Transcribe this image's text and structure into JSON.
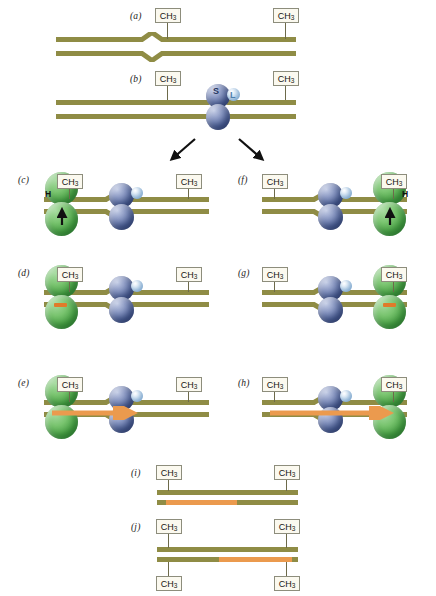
{
  "figure": {
    "type": "molecular-biology-process-diagram",
    "background_color": "#ffffff",
    "colors": {
      "dna_strand": "#8f8c45",
      "repaired_strand": "#eb9a4e",
      "mutS_protein": "#55699f",
      "mutL_protein": "#b6d4ee",
      "mutH_protein": "#4da548",
      "label_box_fill": "#fbf9ef",
      "label_box_border": "#8d8d7c",
      "arrow_black": "#111111",
      "arrow_orange": "#eb9a4e"
    }
  },
  "labels": {
    "methyl": "CH",
    "methyl_sub": "3",
    "protein_s": "S",
    "protein_l": "L",
    "protein_h": "H"
  },
  "panels": [
    {
      "id": "a",
      "letter": "(a)",
      "description": "Hemimethylated duplex DNA with a mismatch bulge (chevron kink) in the centre; CH3 methyl tags on both ends of the top strand.",
      "methyl_labels": [
        "CH3",
        "CH3"
      ],
      "has_mismatch": true,
      "proteins": []
    },
    {
      "id": "b",
      "letter": "(b)",
      "description": "MutS (S) binds the mismatch; MutL (L) joins the complex.",
      "methyl_labels": [
        "CH3",
        "CH3"
      ],
      "has_mismatch": true,
      "proteins": [
        "S",
        "L"
      ]
    },
    {
      "id": "c",
      "letter": "(c)",
      "description": "Left branch: MutH (H) binds the left hemimethylated GATC site; arrow marks incision.",
      "methyl_labels": [
        "CH3",
        "CH3"
      ],
      "proteins": [
        "S",
        "L",
        "H"
      ],
      "protein_side": "left",
      "has_black_arrow": true
    },
    {
      "id": "d",
      "letter": "(d)",
      "description": "Left branch: MutH nicks the unmethylated strand — small orange nick appears at the left.",
      "methyl_labels": [
        "CH3",
        "CH3"
      ],
      "proteins": [
        "S",
        "L",
        "H"
      ],
      "protein_side": "left",
      "has_nick": true
    },
    {
      "id": "e",
      "letter": "(e)",
      "description": "Left branch: excision and resynthesis proceed rightwards (orange arrow) past the mismatch.",
      "methyl_labels": [
        "CH3",
        "CH3"
      ],
      "proteins": [
        "S",
        "L",
        "H"
      ],
      "protein_side": "left",
      "has_orange_arrow": true,
      "orange_arrow_direction": "right"
    },
    {
      "id": "f",
      "letter": "(f)",
      "description": "Right branch: MutH (H) binds the right hemimethylated GATC site; arrow marks incision.",
      "methyl_labels": [
        "CH3",
        "CH3"
      ],
      "proteins": [
        "S",
        "L",
        "H"
      ],
      "protein_side": "right",
      "has_black_arrow": true
    },
    {
      "id": "g",
      "letter": "(g)",
      "description": "Right branch: MutH nicks the unmethylated strand — small orange nick appears at the right.",
      "methyl_labels": [
        "CH3",
        "CH3"
      ],
      "proteins": [
        "S",
        "L",
        "H"
      ],
      "protein_side": "right",
      "has_nick": true
    },
    {
      "id": "h",
      "letter": "(h)",
      "description": "Right branch: excision and resynthesis proceed rightwards (orange arrow) toward the right GATC site.",
      "methyl_labels": [
        "CH3",
        "CH3"
      ],
      "proteins": [
        "S",
        "L",
        "H"
      ],
      "protein_side": "right",
      "has_orange_arrow": true,
      "orange_arrow_direction": "right"
    },
    {
      "id": "i",
      "letter": "(i)",
      "description": "Repaired duplex from the left branch: newly synthesised orange tract occupies the left-centre of the bottom strand; mismatch gone.",
      "methyl_labels": [
        "CH3",
        "CH3"
      ],
      "repaired_segment": {
        "strand": "bottom",
        "start_fraction": 0.06,
        "end_fraction": 0.56
      }
    },
    {
      "id": "j",
      "letter": "(j)",
      "description": "Repaired duplex from the right branch: newly synthesised orange tract occupies the centre-right of the bottom strand; CH3 tags shown on both strands.",
      "methyl_labels_top": [
        "CH3",
        "CH3"
      ],
      "methyl_labels_bottom": [
        "CH3",
        "CH3"
      ],
      "repaired_segment": {
        "strand": "bottom",
        "start_fraction": 0.44,
        "end_fraction": 0.95
      }
    }
  ],
  "branch_arrows": [
    {
      "name": "left-branch-arrow",
      "from_panel": "b",
      "to_panel": "c",
      "direction": "down-left"
    },
    {
      "name": "right-branch-arrow",
      "from_panel": "b",
      "to_panel": "f",
      "direction": "down-right"
    }
  ]
}
